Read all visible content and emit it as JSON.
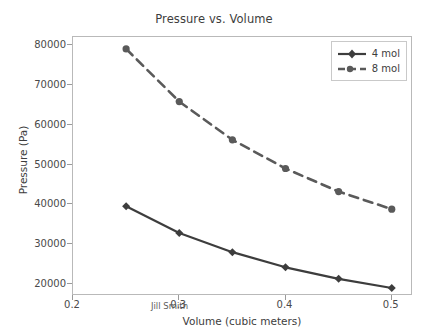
{
  "chart_data": {
    "type": "line",
    "title": "Pressure vs. Volume",
    "xlabel": "Volume (cubic meters)",
    "ylabel": "Pressure (Pa)",
    "xlim": [
      0.2,
      0.52
    ],
    "ylim": [
      17000,
      82000
    ],
    "grid": false,
    "legend_position": "upper right",
    "xticks": [
      "0.2",
      "0.3",
      "0.4",
      "0.5"
    ],
    "xtick_values": [
      0.2,
      0.3,
      0.4,
      0.5
    ],
    "yticks": [
      "20000",
      "30000",
      "40000",
      "50000",
      "60000",
      "70000",
      "80000"
    ],
    "ytick_values": [
      20000,
      30000,
      40000,
      50000,
      60000,
      70000,
      80000
    ],
    "x": [
      0.25,
      0.3,
      0.35,
      0.4,
      0.45,
      0.5
    ],
    "series": [
      {
        "name": "4 mol",
        "values": [
          39500,
          32800,
          28000,
          24200,
          21300,
          19000
        ],
        "color": "#3d3d3d",
        "linestyle": "solid",
        "marker": "diamond"
      },
      {
        "name": "8 mol",
        "values": [
          79000,
          65800,
          56200,
          49000,
          43200,
          38800
        ],
        "color": "#5a5a5a",
        "linestyle": "dashed",
        "marker": "circle"
      }
    ],
    "annotations": [
      {
        "text": "Jill Smith",
        "x": 0.215,
        "y": 21500
      }
    ]
  },
  "colors": {
    "axis": "#b9b9b9",
    "tick": "#9a9a9a",
    "text": "#3d3d3d",
    "background": "#ffffff"
  }
}
